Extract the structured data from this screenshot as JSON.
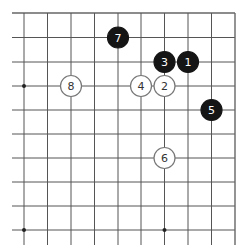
{
  "diagram": {
    "type": "go-board-corner",
    "corner": "top-right",
    "grid": {
      "x_lines": [
        24,
        47.5,
        71,
        94.5,
        118,
        141,
        164.5,
        188,
        211.5,
        235
      ],
      "y_lines": [
        13,
        37.5,
        62,
        86,
        110,
        134,
        158,
        182,
        206,
        230
      ],
      "line_color": "#555555",
      "edge_color": "#666666"
    },
    "star_points": [
      {
        "x": 24,
        "y": 86
      },
      {
        "x": 164.5,
        "y": 86
      },
      {
        "x": 24,
        "y": 230
      },
      {
        "x": 164.5,
        "y": 230
      }
    ],
    "colors": {
      "black_stone": "#151515",
      "white_stone": "#ffffff",
      "white_stroke": "#777777",
      "black_label": "#ffffff",
      "white_label": "#333333"
    },
    "stones": [
      {
        "move": "1",
        "color": "black",
        "x": 188,
        "y": 62
      },
      {
        "move": "2",
        "color": "white",
        "x": 164.5,
        "y": 86
      },
      {
        "move": "3",
        "color": "black",
        "x": 164.5,
        "y": 62
      },
      {
        "move": "4",
        "color": "white",
        "x": 141,
        "y": 86
      },
      {
        "move": "5",
        "color": "black",
        "x": 211.5,
        "y": 110
      },
      {
        "move": "6",
        "color": "white",
        "x": 164.5,
        "y": 158
      },
      {
        "move": "7",
        "color": "black",
        "x": 118,
        "y": 37.5
      },
      {
        "move": "8",
        "color": "white",
        "x": 71,
        "y": 86
      }
    ]
  }
}
